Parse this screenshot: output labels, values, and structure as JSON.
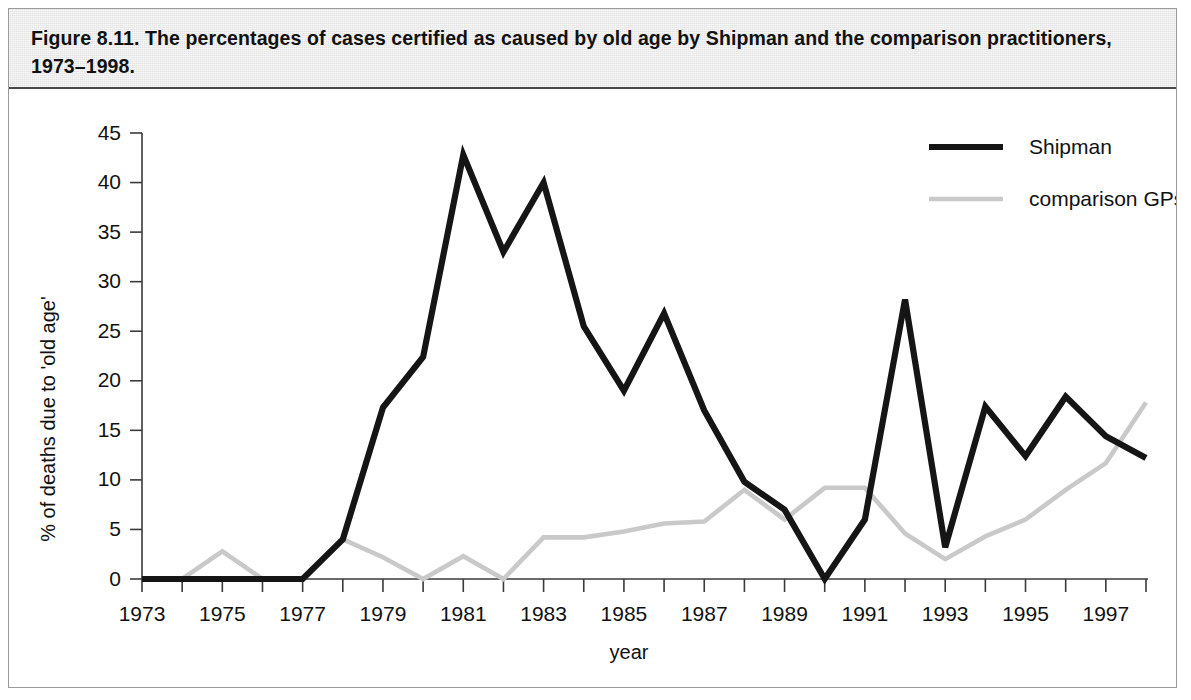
{
  "figure": {
    "caption": "Figure 8.11. The percentages of cases certified as caused by old age by Shipman and the comparison practitioners, 1973–1998."
  },
  "chart_data": {
    "type": "line",
    "title": "Figure 8.11. The percentages of cases certified as caused by old age by Shipman and the comparison practitioners, 1973–1998.",
    "xlabel": "year",
    "ylabel": "% of deaths due to 'old age'",
    "xlim": [
      1973,
      1998
    ],
    "ylim": [
      0,
      45
    ],
    "ytick_values": [
      0,
      5,
      10,
      15,
      20,
      25,
      30,
      35,
      40,
      45
    ],
    "ytick_labels": [
      "0",
      "5",
      "10",
      "15",
      "20",
      "25",
      "30",
      "35",
      "40",
      "45"
    ],
    "xtick_values": [
      1973,
      1974,
      1975,
      1976,
      1977,
      1978,
      1979,
      1980,
      1981,
      1982,
      1983,
      1984,
      1985,
      1986,
      1987,
      1988,
      1989,
      1990,
      1991,
      1992,
      1993,
      1994,
      1995,
      1996,
      1997,
      1998
    ],
    "xtick_labels_shown": [
      "1973",
      "1975",
      "1977",
      "1979",
      "1981",
      "1983",
      "1985",
      "1987",
      "1989",
      "1991",
      "1993",
      "1995",
      "1997"
    ],
    "grid": false,
    "legend_position": "top-right",
    "x": [
      1973,
      1974,
      1975,
      1976,
      1977,
      1978,
      1979,
      1980,
      1981,
      1982,
      1983,
      1984,
      1985,
      1986,
      1987,
      1988,
      1989,
      1990,
      1991,
      1992,
      1993,
      1994,
      1995,
      1996,
      1997,
      1998
    ],
    "series": [
      {
        "name": "Shipman",
        "color": "#151515",
        "style": "solid-thick",
        "values": [
          0,
          0,
          0,
          0,
          0,
          4.0,
          17.3,
          22.4,
          42.8,
          33.0,
          40.0,
          25.5,
          19.0,
          26.8,
          17.0,
          9.8,
          7.0,
          0,
          6.0,
          28.2,
          3.2,
          17.4,
          12.4,
          18.4,
          14.4,
          12.2
        ]
      },
      {
        "name": "comparison GPs",
        "color": "#c9c9c9",
        "style": "solid-light",
        "values": [
          0,
          0,
          2.8,
          0,
          0,
          4.0,
          2.2,
          0,
          2.3,
          0,
          4.2,
          4.2,
          4.8,
          5.6,
          5.8,
          9.0,
          6.0,
          9.2,
          9.2,
          4.6,
          2.0,
          4.3,
          6.0,
          9.0,
          11.7,
          17.8
        ]
      }
    ],
    "legend": [
      {
        "label": "Shipman",
        "color": "#151515"
      },
      {
        "label": "comparison GPs",
        "color": "#c9c9c9"
      }
    ]
  },
  "axes": {
    "y_title": "% of deaths due to 'old age'",
    "x_title": "year"
  }
}
